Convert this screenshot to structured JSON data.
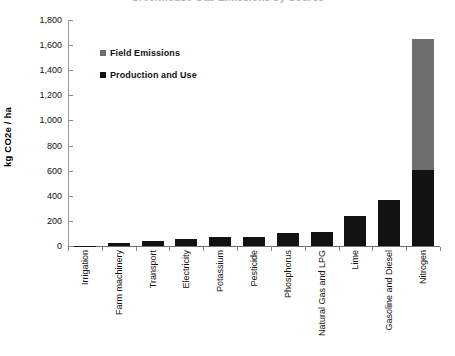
{
  "chart_data": {
    "type": "bar",
    "title": "",
    "xlabel": "",
    "ylabel": "kg CO2e / ha",
    "ylim": [
      0,
      1800
    ],
    "ytick_step": 200,
    "ytick_labels": [
      "0",
      "200",
      "400",
      "600",
      "800",
      "1,000",
      "1,200",
      "1,400",
      "1,600",
      "1,800"
    ],
    "grid": false,
    "stacked": true,
    "legend_position": "upper-left-inside",
    "categories": [
      "Irrigation",
      "Farm machinery",
      "Transport",
      "Electricity",
      "Potassium",
      "Pesticide",
      "Phosphorus",
      "Natural Gas and LPG",
      "Lime",
      "Gasoline and Diesel",
      "Nitrogen"
    ],
    "series": [
      {
        "name": "Production and Use",
        "color": "#121212",
        "values": [
          2,
          25,
          40,
          55,
          70,
          75,
          105,
          115,
          240,
          370,
          605
        ]
      },
      {
        "name": "Field Emissions",
        "color": "#6e6e6e",
        "values": [
          0,
          0,
          0,
          0,
          0,
          0,
          0,
          0,
          0,
          0,
          1040
        ]
      }
    ],
    "totals": [
      2,
      25,
      40,
      55,
      70,
      75,
      105,
      115,
      240,
      370,
      1645
    ]
  },
  "legend": {
    "items": [
      {
        "label": "Field Emissions",
        "swatch": "field"
      },
      {
        "label": "Production and Use",
        "swatch": "prod"
      }
    ]
  },
  "axis": {
    "y_title": "kg CO2e / ha"
  },
  "title_strip": {
    "text": "Greenhouse Gas Emissions by Source"
  }
}
